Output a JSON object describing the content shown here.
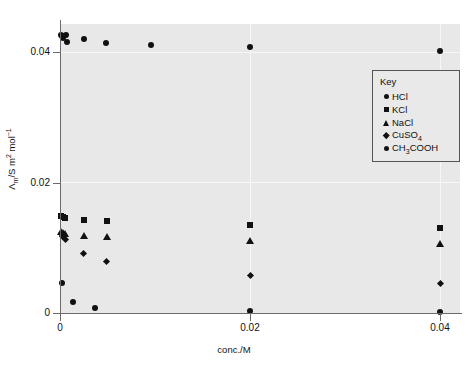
{
  "chart_data": {
    "type": "scatter",
    "title": "",
    "xlabel": "conc./M",
    "ylabel": "Λ_m/S m2 mol-1",
    "ylabel_parts": {
      "symbol": "Λ",
      "sub": "m",
      "unit": "/S m",
      "exp": "2",
      "unit2": " mol",
      "exp2": "−1"
    },
    "xlim": [
      0,
      0.042
    ],
    "ylim": [
      0,
      0.0442
    ],
    "xticks": [
      0,
      0.02,
      0.04
    ],
    "xticklabels": [
      "0",
      "0.02",
      "0.04"
    ],
    "yticks": [
      0,
      0.02,
      0.04
    ],
    "yticklabels": [
      "0",
      "0.02",
      "0.04"
    ],
    "grid": true,
    "legend_position": "upper right",
    "series": [
      {
        "name": "HCl",
        "marker": "circle",
        "color": "#111111",
        "points": [
          {
            "x": 0.0001,
            "y": 0.04255
          },
          {
            "x": 0.0002,
            "y": 0.0424
          },
          {
            "x": 0.00035,
            "y": 0.04215
          },
          {
            "x": 0.0006,
            "y": 0.0426
          },
          {
            "x": 0.00075,
            "y": 0.0415
          },
          {
            "x": 0.0025,
            "y": 0.04195
          },
          {
            "x": 0.0048,
            "y": 0.04145
          },
          {
            "x": 0.0096,
            "y": 0.04105
          },
          {
            "x": 0.02,
            "y": 0.0407
          },
          {
            "x": 0.04,
            "y": 0.0402
          }
        ]
      },
      {
        "name": "KCl",
        "marker": "square",
        "color": "#111111",
        "points": [
          {
            "x": 0.0001,
            "y": 0.0148
          },
          {
            "x": 0.00028,
            "y": 0.01465
          },
          {
            "x": 0.00048,
            "y": 0.01455
          },
          {
            "x": 0.0025,
            "y": 0.0143
          },
          {
            "x": 0.0049,
            "y": 0.0141
          },
          {
            "x": 0.02,
            "y": 0.01355
          },
          {
            "x": 0.04,
            "y": 0.013
          }
        ]
      },
      {
        "name": "NaCl",
        "marker": "triangle",
        "color": "#111111",
        "points": [
          {
            "x": 0.00012,
            "y": 0.01255
          },
          {
            "x": 0.0003,
            "y": 0.0124
          },
          {
            "x": 0.00055,
            "y": 0.0122
          },
          {
            "x": 0.0025,
            "y": 0.01195
          },
          {
            "x": 0.0049,
            "y": 0.0117
          },
          {
            "x": 0.02,
            "y": 0.01115
          },
          {
            "x": 0.04,
            "y": 0.0106
          }
        ]
      },
      {
        "name": "CuSO4",
        "marker": "diamond",
        "color": "#111111",
        "points": [
          {
            "x": 0.00012,
            "y": 0.01215
          },
          {
            "x": 0.0003,
            "y": 0.01175
          },
          {
            "x": 0.00055,
            "y": 0.0112
          },
          {
            "x": 0.0025,
            "y": 0.0091
          },
          {
            "x": 0.0049,
            "y": 0.0079
          },
          {
            "x": 0.02,
            "y": 0.0058
          },
          {
            "x": 0.04,
            "y": 0.00455
          }
        ]
      },
      {
        "name": "CH3COOH",
        "marker": "circle",
        "color": "#111111",
        "points": [
          {
            "x": 0.0002,
            "y": 0.00455
          },
          {
            "x": 0.00135,
            "y": 0.00175
          },
          {
            "x": 0.0037,
            "y": 0.00075
          },
          {
            "x": 0.02,
            "y": 0.00025
          },
          {
            "x": 0.04,
            "y": 0.0002
          }
        ]
      }
    ],
    "legend": {
      "title": "Key",
      "entries": [
        {
          "label": "HCl",
          "marker": "circle"
        },
        {
          "label": "KCl",
          "marker": "square"
        },
        {
          "label": "NaCl",
          "marker": "triangle"
        },
        {
          "label": "CuSO",
          "sub": "4",
          "marker": "diamond"
        },
        {
          "label": "CH",
          "sub": "3",
          "label2": "COOH",
          "marker": "circle"
        }
      ]
    }
  }
}
